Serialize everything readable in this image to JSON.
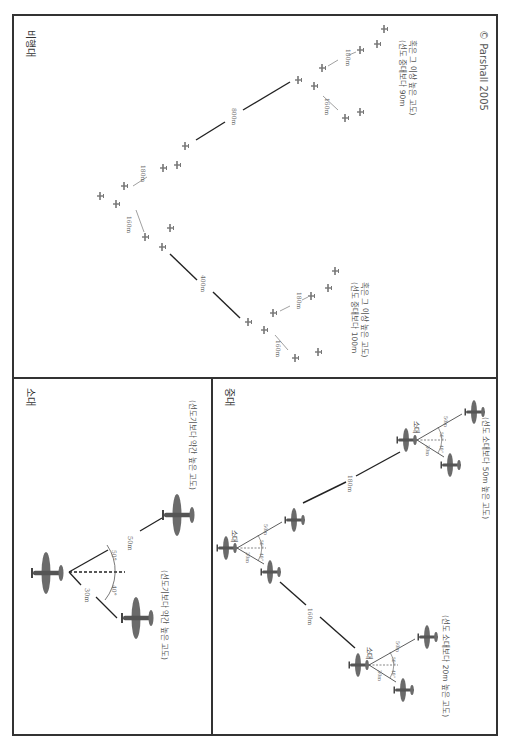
{
  "copyright": "© Parshall 2005",
  "panels": {
    "hikotai": {
      "title": "비행대",
      "distances": {
        "between_companies": "400m",
        "between_companies_2": "800m",
        "chutai_a_left": "160m",
        "chutai_a_right": "180m",
        "chutai_b_left": "160m",
        "chutai_b_right": "180m",
        "chutai_c_left": "160m",
        "chutai_c_right": "180m"
      },
      "note_lower": [
        "(선도 중대보다 100m",
        "혹은 그 이상 높은 고도)"
      ],
      "note_upper": [
        "(선도 중대보다 90m",
        "혹은 그 이상 높은 고도)"
      ]
    },
    "shotai": {
      "title": "소대",
      "dist_left": "30m",
      "dist_right": "50m",
      "angle_left": "40°",
      "angle_right": "50°",
      "note_left": "(선도기보다 약간 높은 고도)",
      "note_right": "(선도기보다 약간 높은 고도)"
    },
    "chutai": {
      "title": "중대",
      "dist_left": "160m",
      "dist_right": "180m",
      "sub_label": "소대",
      "sub_dist_left": "30m",
      "sub_dist_right": "50m",
      "sub_angle_left": "40°",
      "sub_angle_right": "50°",
      "note_left": "(선도 소대보다 20m 높은 고도)",
      "note_right": "(선도 소대보다 50m 높은 고도)"
    }
  },
  "colors": {
    "border": "#333333",
    "plane": "#6b6b6b",
    "line": "#222222",
    "text": "#666666"
  }
}
